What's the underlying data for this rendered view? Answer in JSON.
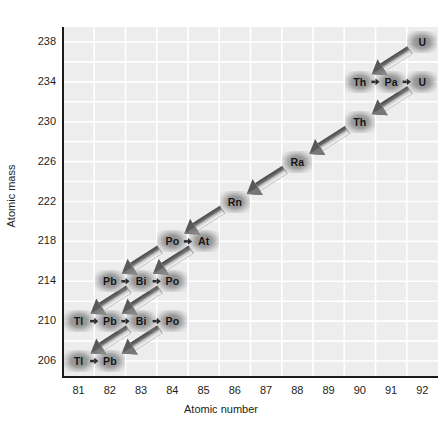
{
  "axes": {
    "x_title": "Atomic number",
    "y_title": "Atomic mass",
    "x_ticks": [
      "81",
      "82",
      "83",
      "84",
      "85",
      "86",
      "87",
      "88",
      "89",
      "90",
      "91",
      "92"
    ],
    "y_ticks": [
      "238",
      "234",
      "230",
      "226",
      "222",
      "218",
      "214",
      "210",
      "206"
    ]
  },
  "colors": {
    "plot_background": "#ededed",
    "gridline": "#ffffff",
    "axis": "#1b1b1b",
    "text": "#231f20",
    "node_halo": "#878787",
    "node_label": "#141414",
    "alpha_arrow_dark": "#5a5a5a",
    "alpha_arrow_light": "#e9e9e9",
    "beta_arrow": "#2b2b2b"
  },
  "chart_data": {
    "type": "scatter",
    "title": "",
    "xlabel": "Atomic number",
    "ylabel": "Atomic mass",
    "xlim": [
      80.5,
      92.5
    ],
    "ylim": [
      204.5,
      239.5
    ],
    "x_ticks": [
      81,
      82,
      83,
      84,
      85,
      86,
      87,
      88,
      89,
      90,
      91,
      92
    ],
    "y_ticks": [
      206,
      210,
      214,
      218,
      222,
      226,
      230,
      234,
      238
    ],
    "grid": true,
    "grid_x_step": 1,
    "grid_y_step": 2,
    "legend": "none",
    "nodes": [
      {
        "id": "U238",
        "label": "U",
        "z": 92,
        "a": 238
      },
      {
        "id": "Th234",
        "label": "Th",
        "z": 90,
        "a": 234
      },
      {
        "id": "Pa234",
        "label": "Pa",
        "z": 91,
        "a": 234
      },
      {
        "id": "U234",
        "label": "U",
        "z": 92,
        "a": 234
      },
      {
        "id": "Th230",
        "label": "Th",
        "z": 90,
        "a": 230
      },
      {
        "id": "Ra226",
        "label": "Ra",
        "z": 88,
        "a": 226
      },
      {
        "id": "Rn222",
        "label": "Rn",
        "z": 86,
        "a": 222
      },
      {
        "id": "Po218",
        "label": "Po",
        "z": 84,
        "a": 218
      },
      {
        "id": "At218",
        "label": "At",
        "z": 85,
        "a": 218
      },
      {
        "id": "Pb214",
        "label": "Pb",
        "z": 82,
        "a": 214
      },
      {
        "id": "Bi214",
        "label": "Bi",
        "z": 83,
        "a": 214
      },
      {
        "id": "Po214",
        "label": "Po",
        "z": 84,
        "a": 214
      },
      {
        "id": "Tl210",
        "label": "Tl",
        "z": 81,
        "a": 210
      },
      {
        "id": "Pb210",
        "label": "Pb",
        "z": 82,
        "a": 210
      },
      {
        "id": "Bi210",
        "label": "Bi",
        "z": 83,
        "a": 210
      },
      {
        "id": "Po210",
        "label": "Po",
        "z": 84,
        "a": 210
      },
      {
        "id": "Tl206",
        "label": "Tl",
        "z": 81,
        "a": 206
      },
      {
        "id": "Pb206",
        "label": "Pb",
        "z": 82,
        "a": 206
      }
    ],
    "alpha_decays": [
      {
        "from": "U238",
        "to": "Th234"
      },
      {
        "from": "U234",
        "to": "Th230"
      },
      {
        "from": "Th230",
        "to": "Ra226"
      },
      {
        "from": "Ra226",
        "to": "Rn222"
      },
      {
        "from": "Rn222",
        "to": "Po218"
      },
      {
        "from": "Po218",
        "to": "Pb214"
      },
      {
        "from": "At218",
        "to": "Bi214"
      },
      {
        "from": "Po214",
        "to": "Pb210"
      },
      {
        "from": "Bi214",
        "to": "Tl210"
      },
      {
        "from": "Po210",
        "to": "Pb206"
      },
      {
        "from": "Bi210",
        "to": "Tl206"
      }
    ],
    "beta_decays": [
      {
        "from": "Th234",
        "to": "Pa234"
      },
      {
        "from": "Pa234",
        "to": "U234"
      },
      {
        "from": "Po218",
        "to": "At218"
      },
      {
        "from": "Pb214",
        "to": "Bi214"
      },
      {
        "from": "Bi214",
        "to": "Po214"
      },
      {
        "from": "Tl210",
        "to": "Pb210"
      },
      {
        "from": "Pb210",
        "to": "Bi210"
      },
      {
        "from": "Bi210",
        "to": "Po210"
      },
      {
        "from": "Tl206",
        "to": "Pb206"
      }
    ]
  }
}
